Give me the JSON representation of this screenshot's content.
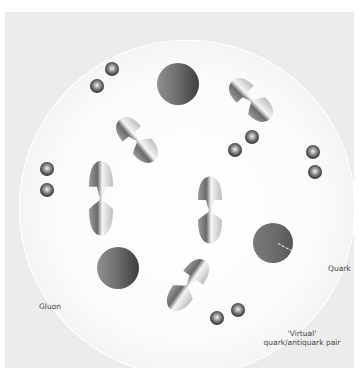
{
  "diagram": {
    "title": "",
    "labels": {
      "gluon": "Gluon",
      "quark": "Quark",
      "virtual_line1": "'Virtual'",
      "virtual_line2": "quark/antiquark pair"
    },
    "colors": {
      "panel_background": "#ececec",
      "region_fill": "#ffffff",
      "region_outline": "#ffffff",
      "quark_dark": "#3e3e3e",
      "quark_light": "#909090",
      "bead_dark": "#2a2a2a",
      "text": "#444444"
    },
    "elements": {
      "quarks": [
        {
          "id": "quark-top",
          "x": 178,
          "y": 84,
          "r": 21
        },
        {
          "id": "quark-left",
          "x": 118,
          "y": 268,
          "r": 21
        },
        {
          "id": "quark-right",
          "x": 273,
          "y": 243,
          "r": 20
        }
      ],
      "gluons": [
        {
          "id": "gluon-top-right",
          "x": 251,
          "y": 100,
          "angle": -45
        },
        {
          "id": "gluon-upper-left",
          "x": 137,
          "y": 140,
          "angle": -40
        },
        {
          "id": "gluon-left",
          "x": 101,
          "y": 196,
          "angle": 0
        },
        {
          "id": "gluon-center",
          "x": 209,
          "y": 207,
          "angle": 0
        },
        {
          "id": "gluon-bottom",
          "x": 188,
          "y": 284,
          "angle": 35
        }
      ],
      "virtual_pairs": [
        {
          "id": "pair-top-left",
          "beads": [
            [
              97,
              86
            ],
            [
              112,
              69
            ]
          ]
        },
        {
          "id": "pair-right-center",
          "beads": [
            [
              235,
              150
            ],
            [
              252,
              137
            ]
          ]
        },
        {
          "id": "pair-far-right",
          "beads": [
            [
              313,
              152
            ],
            [
              315,
              172
            ]
          ]
        },
        {
          "id": "pair-far-left",
          "beads": [
            [
              47,
              169
            ],
            [
              47,
              190
            ]
          ]
        },
        {
          "id": "pair-bottom",
          "beads": [
            [
              217,
              318
            ],
            [
              238,
              310
            ]
          ]
        }
      ]
    }
  }
}
